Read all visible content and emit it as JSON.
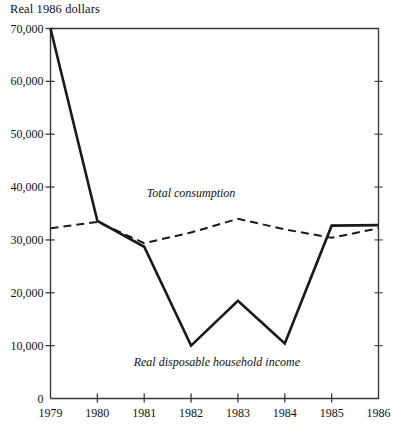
{
  "chart_data": {
    "type": "line",
    "title": "",
    "ylabel": "Real 1986 dollars",
    "xlabel": "",
    "grid": false,
    "legend_position": "inline-annotation",
    "x": [
      "1979",
      "1980",
      "1981",
      "1982",
      "1983",
      "1984",
      "1985",
      "1986"
    ],
    "xlim": [
      1979,
      1986
    ],
    "ylim": [
      0,
      70000
    ],
    "ytick_labels": [
      "0",
      "10,000",
      "20,000",
      "30,000",
      "40,000",
      "50,000",
      "60,000",
      "70,000"
    ],
    "ytick_values": [
      0,
      10000,
      20000,
      30000,
      40000,
      50000,
      60000,
      70000
    ],
    "xtick_labels": [
      "1979",
      "1980",
      "1981",
      "1982",
      "1983",
      "1984",
      "1985",
      "1986"
    ],
    "series": [
      {
        "name": "Real disposable household income",
        "style": "solid",
        "color": "#1a1a1a",
        "values": [
          70000,
          33600,
          28700,
          10000,
          18500,
          10400,
          32700,
          32800
        ]
      },
      {
        "name": "Total consumption",
        "style": "dashed",
        "color": "#1a1a1a",
        "values": [
          32200,
          33400,
          29400,
          31400,
          34000,
          32000,
          30400,
          32200
        ]
      }
    ],
    "annotations": [
      {
        "text": "Total consumption",
        "x": 1982.0,
        "y": 38600
      },
      {
        "text": "Real disposable household income",
        "x": 1982.55,
        "y": 6700
      }
    ]
  }
}
